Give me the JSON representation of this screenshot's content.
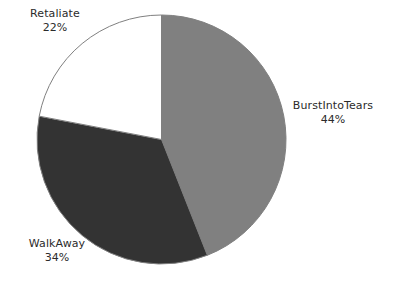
{
  "chart_data": {
    "type": "pie",
    "title": "",
    "categories": [
      "BurstIntoTears",
      "WalkAway",
      "Retaliate"
    ],
    "values": [
      44,
      34,
      22
    ],
    "value_unit": "%",
    "labels": [
      "44%",
      "34%",
      "22%"
    ],
    "colors": [
      "#808080",
      "#333333",
      "#ffffff"
    ],
    "stroke_color": "#808080",
    "background": "#ffffff",
    "start_angle_deg": 0,
    "direction": "clockwise",
    "legend": "none",
    "grid": false,
    "slices": [
      {
        "name": "BurstIntoTears",
        "value": 44,
        "label": "BurstIntoTears",
        "percent_label": "44%",
        "color": "#808080",
        "start_deg": 0,
        "end_deg": 158.4
      },
      {
        "name": "WalkAway",
        "value": 34,
        "label": "WalkAway",
        "percent_label": "34%",
        "color": "#333333",
        "start_deg": 158.4,
        "end_deg": 280.8
      },
      {
        "name": "Retaliate",
        "value": 22,
        "label": "Retaliate",
        "percent_label": "22%",
        "color": "#ffffff",
        "start_deg": 280.8,
        "end_deg": 360
      }
    ]
  }
}
